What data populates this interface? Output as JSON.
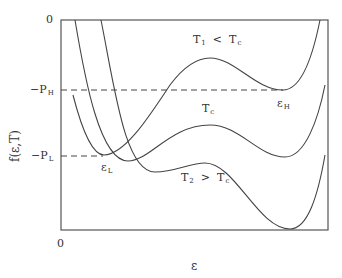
{
  "figure": {
    "y_axis_label": "f(ε,T)",
    "x_axis_label": "ε",
    "y_top_tick": "0",
    "x_origin_tick": "0",
    "levels": [
      {
        "id": "PH",
        "prefix": "−P",
        "sub": "H"
      },
      {
        "id": "PL",
        "prefix": "−P",
        "sub": "L"
      }
    ],
    "point_labels": [
      {
        "id": "eps_H",
        "main": "ε",
        "sub": "H"
      },
      {
        "id": "eps_L",
        "main": "ε",
        "sub": "L"
      }
    ],
    "curves": [
      {
        "id": "T1",
        "main": "T",
        "sub": "1",
        "relation": "<",
        "ref_main": "T",
        "ref_sub": "c"
      },
      {
        "id": "Tc",
        "main": "T",
        "sub": "c"
      },
      {
        "id": "T2",
        "main": "T",
        "sub": "2",
        "relation": ">",
        "ref_main": "T",
        "ref_sub": "c"
      }
    ]
  }
}
